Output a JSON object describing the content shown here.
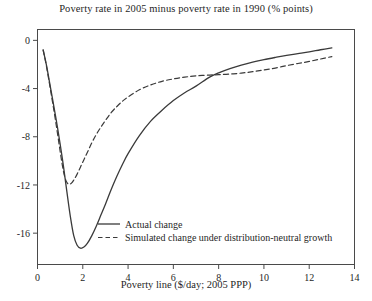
{
  "chart_data": {
    "type": "line",
    "title": "Poverty rate in 2005 minus poverty rate in 1990 (% points)",
    "xlabel": "Poverty line ($/day; 2005 PPP)",
    "ylabel": "",
    "xlim": [
      0,
      14
    ],
    "ylim": [
      -18.6,
      0.9
    ],
    "xticks": [
      0,
      2,
      4,
      6,
      8,
      10,
      12,
      14
    ],
    "xticklabels": [
      "0",
      "2",
      "4",
      "6",
      "8",
      "10",
      "12",
      "14"
    ],
    "yticks": [
      0,
      -4,
      -8,
      -12,
      -16
    ],
    "yticklabels": [
      "0",
      "-4",
      "-8",
      "-12",
      "-16"
    ],
    "grid": false,
    "legend_position": "bottom-left-inside",
    "series": [
      {
        "name": "Actual change",
        "style": "solid",
        "color": "#3a3a3a",
        "x": [
          0.25,
          0.4,
          0.6,
          0.8,
          1.0,
          1.15,
          1.3,
          1.45,
          1.6,
          1.75,
          1.9,
          2.05,
          2.2,
          2.4,
          2.6,
          2.8,
          3.0,
          3.25,
          3.5,
          3.75,
          4.0,
          4.5,
          5.0,
          5.5,
          6.0,
          6.5,
          7.0,
          7.6,
          8.0,
          8.5,
          9.0,
          9.5,
          10.0,
          10.5,
          11.0,
          11.5,
          12.0,
          12.5,
          13.0
        ],
        "y": [
          -0.8,
          -2.1,
          -4.2,
          -6.3,
          -8.6,
          -10.5,
          -12.6,
          -14.6,
          -16.2,
          -17.0,
          -17.25,
          -17.15,
          -16.85,
          -16.2,
          -15.4,
          -14.5,
          -13.6,
          -12.4,
          -11.3,
          -10.3,
          -9.4,
          -7.9,
          -6.7,
          -5.8,
          -5.0,
          -4.35,
          -3.8,
          -3.05,
          -2.7,
          -2.35,
          -2.05,
          -1.8,
          -1.6,
          -1.42,
          -1.25,
          -1.1,
          -0.95,
          -0.78,
          -0.62
        ]
      },
      {
        "name": "Simulated change under distribution-neutral growth",
        "style": "dashed",
        "color": "#3a3a3a",
        "x": [
          0.25,
          0.4,
          0.6,
          0.8,
          1.0,
          1.1,
          1.2,
          1.3,
          1.4,
          1.5,
          1.6,
          1.75,
          1.9,
          2.05,
          2.2,
          2.4,
          2.6,
          2.8,
          3.0,
          3.25,
          3.5,
          3.75,
          4.0,
          4.5,
          5.0,
          5.5,
          6.0,
          6.5,
          7.0,
          7.6,
          8.0,
          8.5,
          9.0,
          9.5,
          10.0,
          10.5,
          11.0,
          11.5,
          12.0,
          12.5,
          13.0
        ],
        "y": [
          -0.8,
          -2.2,
          -4.4,
          -6.7,
          -9.2,
          -10.4,
          -11.3,
          -11.8,
          -11.95,
          -11.85,
          -11.6,
          -11.1,
          -10.5,
          -9.9,
          -9.3,
          -8.5,
          -7.8,
          -7.2,
          -6.65,
          -6.0,
          -5.5,
          -5.05,
          -4.7,
          -4.1,
          -3.7,
          -3.4,
          -3.2,
          -3.05,
          -2.95,
          -2.88,
          -2.85,
          -2.8,
          -2.72,
          -2.6,
          -2.45,
          -2.3,
          -2.1,
          -1.92,
          -1.75,
          -1.55,
          -1.35
        ]
      }
    ],
    "legend": [
      {
        "label": "Actual change",
        "style": "solid"
      },
      {
        "label": "Simulated change under distribution-neutral growth",
        "style": "dashed"
      }
    ]
  }
}
